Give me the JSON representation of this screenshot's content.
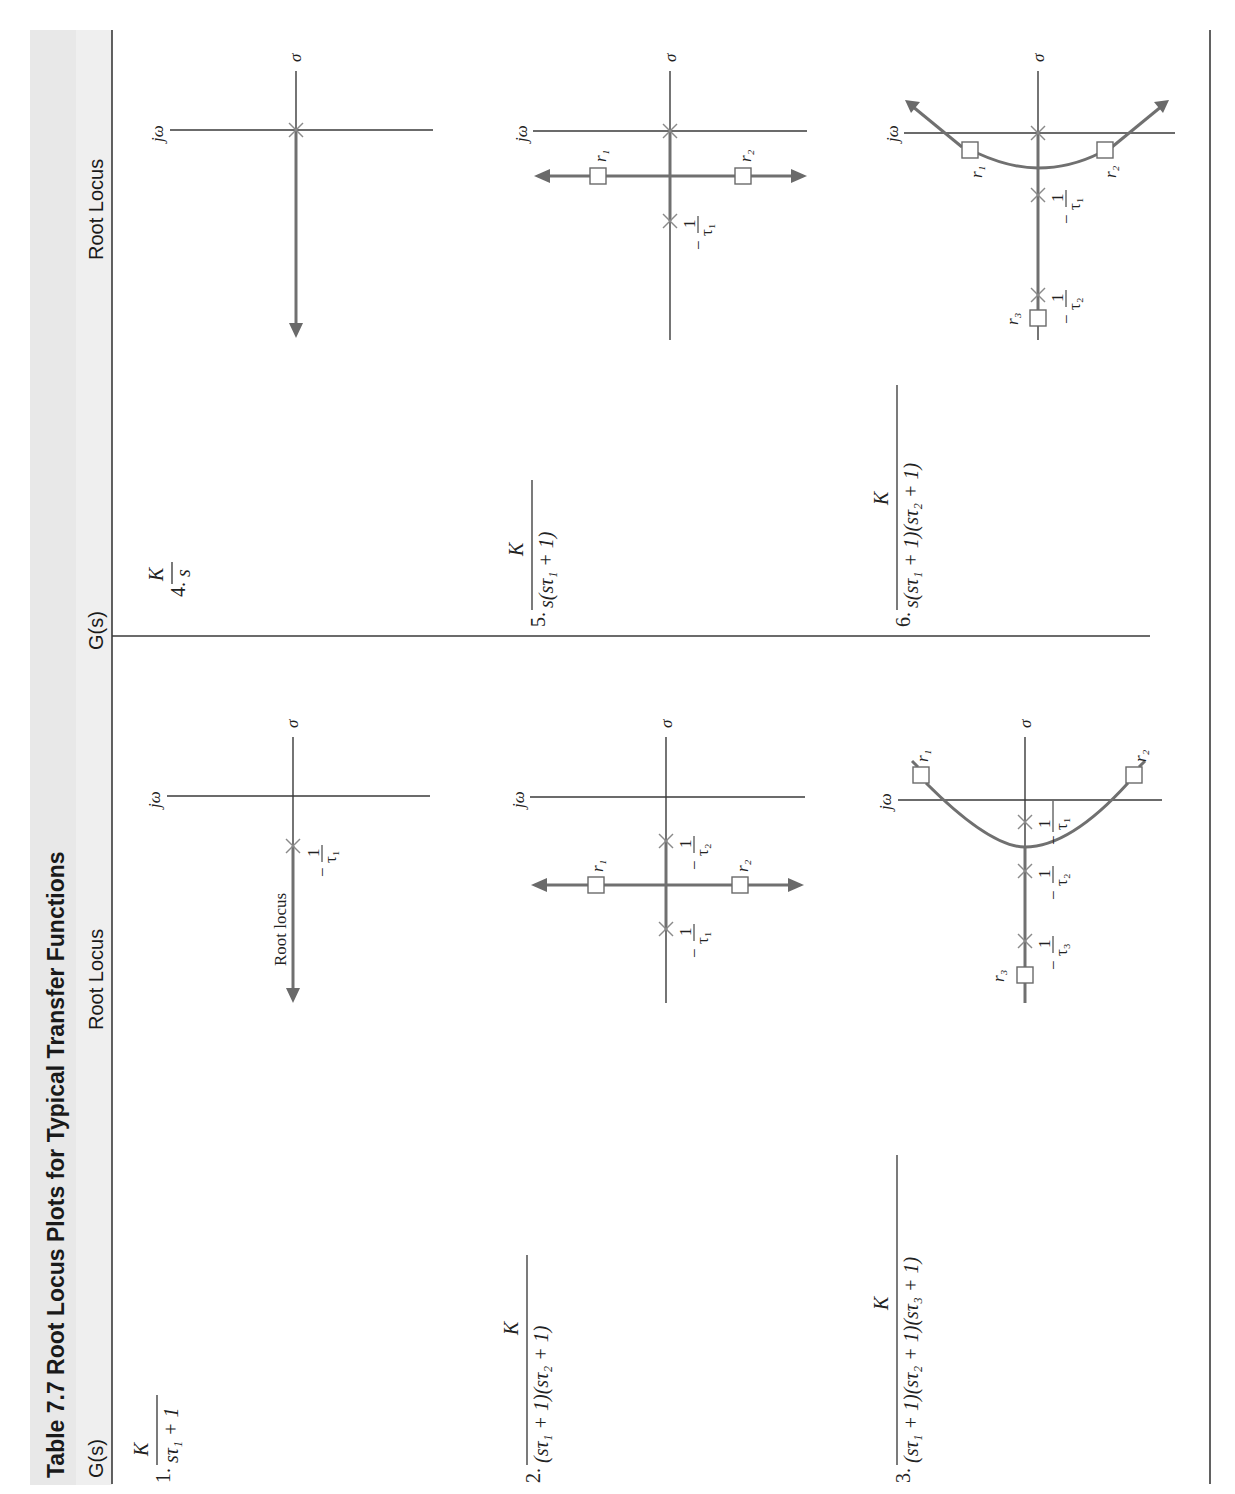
{
  "table": {
    "title": "Table 7.7   Root Locus Plots for Typical Transfer Functions",
    "header_band_color": "#e8e8e8",
    "columns": [
      {
        "label": "G(s)"
      },
      {
        "label": "Root Locus"
      },
      {
        "label": "G(s)"
      },
      {
        "label": "Root Locus"
      }
    ],
    "rows": [
      {
        "number": "1.",
        "numerator": "K",
        "denominator": "sτ₁ + 1",
        "axis_labels": {
          "imag": "jω",
          "real": "σ"
        },
        "poles": [
          "−1/τ₁"
        ],
        "roots": [],
        "annotation": "Root locus"
      },
      {
        "number": "2.",
        "numerator": "K",
        "denominator": "(sτ₁ + 1)(sτ₂ + 1)",
        "axis_labels": {
          "imag": "jω",
          "real": "σ"
        },
        "poles": [
          "−1/τ₂",
          "−1/τ₁"
        ],
        "roots": [
          "r₁",
          "r₂"
        ]
      },
      {
        "number": "3.",
        "numerator": "K",
        "denominator": "(sτ₁ + 1)(sτ₂ + 1)(sτ₃ + 1)",
        "axis_labels": {
          "imag": "jω",
          "real": "σ"
        },
        "poles": [
          "−1/τ₁",
          "−1/τ₂",
          "−1/τ₃"
        ],
        "roots": [
          "r₁",
          "r₂",
          "r₃"
        ]
      },
      {
        "number": "4.",
        "numerator": "K",
        "denominator": "s",
        "axis_labels": {
          "imag": "jω",
          "real": "σ"
        },
        "poles": [
          "0"
        ],
        "roots": []
      },
      {
        "number": "5.",
        "numerator": "K",
        "denominator": "s(sτ₁ + 1)",
        "axis_labels": {
          "imag": "jω",
          "real": "σ"
        },
        "poles": [
          "0",
          "−1/τ₁"
        ],
        "roots": [
          "r₁",
          "r₂"
        ]
      },
      {
        "number": "6.",
        "numerator": "K",
        "denominator": "s(sτ₁ + 1)(sτ₂ + 1)",
        "axis_labels": {
          "imag": "jω",
          "real": "σ"
        },
        "poles": [
          "0",
          "−1/τ₁",
          "−1/τ₂"
        ],
        "roots": [
          "r₁",
          "r₂",
          "r₃"
        ]
      }
    ]
  },
  "text": {
    "one": "1",
    "minus": "−",
    "tau1": "τ₁",
    "tau2": "τ₂",
    "tau3": "τ₃",
    "jw": "jω",
    "sigma": "σ",
    "r1": "r₁",
    "r2": "r₂",
    "r3": "r₃"
  }
}
